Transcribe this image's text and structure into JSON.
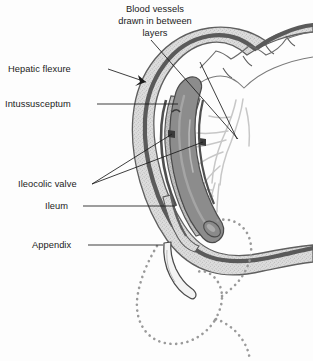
{
  "figure": {
    "background_color": "#fdfdfd",
    "line_color": "#1b1b1b"
  },
  "labels": {
    "blood_vessels": {
      "line1": "Blood vessels",
      "line2": "drawn in between",
      "line3": "layers"
    },
    "hepatic_flexure": "Hepatic flexure",
    "intussusceptum": "Intussusceptum",
    "ileocolic_valve": "Ileocolic valve",
    "ileum": "Ileum",
    "appendix": "Appendix"
  },
  "anatomy": {
    "colon_wall_outer_color": "#6d6d6d",
    "colon_wall_fill_color": "#d8d8d8",
    "intussusceptum_core_color": "#8a8a8a",
    "vessel_color": "#c9c9c9",
    "dotted_outline_color": "#9a9a9a",
    "parts": [
      "transverse colon",
      "hepatic flexure",
      "intussusceptum",
      "intussuscipiens",
      "ileocolic valve",
      "ileum",
      "appendix",
      "mesenteric blood vessels",
      "original cecum position (dotted)"
    ]
  }
}
